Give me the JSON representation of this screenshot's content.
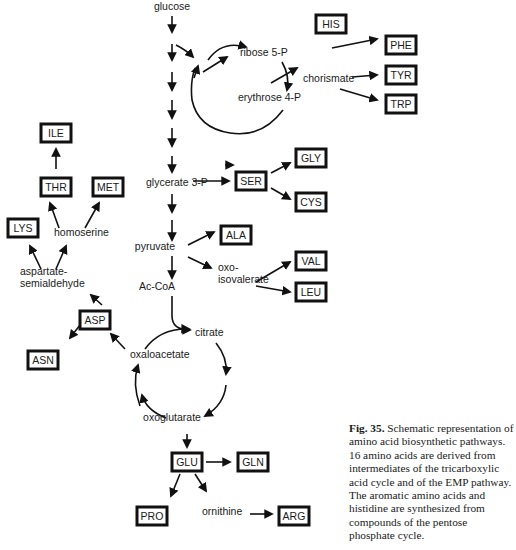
{
  "diagram": {
    "title": "Schematic representation of amino acid biosynthetic pathways",
    "intermediates": [
      {
        "id": "glucose",
        "label": "glucose",
        "x": 172,
        "y": 10
      },
      {
        "id": "ribose5p",
        "label": "ribose  5-P",
        "x": 240,
        "y": 56
      },
      {
        "id": "erythrose4p",
        "label": "erythrose  4-P",
        "x": 238,
        "y": 101
      },
      {
        "id": "chorismate",
        "label": "chorismate",
        "x": 303,
        "y": 82
      },
      {
        "id": "glycerate3p",
        "label": "glycerate  3-P",
        "x": 146,
        "y": 186
      },
      {
        "id": "pyruvate",
        "label": "pyruvate",
        "x": 155,
        "y": 250
      },
      {
        "id": "acCoA",
        "label": "Ac-CoA",
        "x": 157,
        "y": 290
      },
      {
        "id": "oxoisovalerate_1",
        "label": "oxo-",
        "x": 218,
        "y": 271
      },
      {
        "id": "oxoisovalerate_2",
        "label": "isovalerate",
        "x": 218,
        "y": 283
      },
      {
        "id": "homoserine",
        "label": "homoserine",
        "x": 54,
        "y": 236
      },
      {
        "id": "aspsemi_1",
        "label": "aspartate-",
        "x": 20,
        "y": 275
      },
      {
        "id": "aspsemi_2",
        "label": "semialdehyde",
        "x": 20,
        "y": 287
      },
      {
        "id": "citrate",
        "label": "citrate",
        "x": 195,
        "y": 336
      },
      {
        "id": "oxaloacetate",
        "label": "oxaloacetate",
        "x": 130,
        "y": 358
      },
      {
        "id": "oxoglutarate",
        "label": "oxoglutarate",
        "x": 172,
        "y": 421
      },
      {
        "id": "ornithine",
        "label": "ornithine",
        "x": 202,
        "y": 515
      }
    ],
    "amino_acids": [
      {
        "id": "his",
        "label": "HIS",
        "x": 316,
        "y": 15,
        "w": 30,
        "h": 18
      },
      {
        "id": "phe",
        "label": "PHE",
        "x": 386,
        "y": 36,
        "w": 30,
        "h": 18
      },
      {
        "id": "tyr",
        "label": "TYR",
        "x": 386,
        "y": 66,
        "w": 30,
        "h": 18
      },
      {
        "id": "trp",
        "label": "TRP",
        "x": 386,
        "y": 95,
        "w": 30,
        "h": 18
      },
      {
        "id": "ile",
        "label": "ILE",
        "x": 41,
        "y": 124,
        "w": 30,
        "h": 18
      },
      {
        "id": "thr",
        "label": "THR",
        "x": 41,
        "y": 178,
        "w": 30,
        "h": 18
      },
      {
        "id": "met",
        "label": "MET",
        "x": 93,
        "y": 178,
        "w": 30,
        "h": 18
      },
      {
        "id": "lys",
        "label": "LYS",
        "x": 8,
        "y": 219,
        "w": 30,
        "h": 18
      },
      {
        "id": "ser",
        "label": "SER",
        "x": 236,
        "y": 172,
        "w": 30,
        "h": 18
      },
      {
        "id": "gly",
        "label": "GLY",
        "x": 296,
        "y": 149,
        "w": 30,
        "h": 18
      },
      {
        "id": "cys",
        "label": "CYS",
        "x": 296,
        "y": 193,
        "w": 30,
        "h": 18
      },
      {
        "id": "ala",
        "label": "ALA",
        "x": 221,
        "y": 226,
        "w": 30,
        "h": 18
      },
      {
        "id": "val",
        "label": "VAL",
        "x": 296,
        "y": 252,
        "w": 30,
        "h": 18
      },
      {
        "id": "leu",
        "label": "LEU",
        "x": 296,
        "y": 283,
        "w": 30,
        "h": 18
      },
      {
        "id": "asp",
        "label": "ASP",
        "x": 80,
        "y": 311,
        "w": 30,
        "h": 18
      },
      {
        "id": "asn",
        "label": "ASN",
        "x": 28,
        "y": 351,
        "w": 30,
        "h": 18
      },
      {
        "id": "glu",
        "label": "GLU",
        "x": 172,
        "y": 453,
        "w": 30,
        "h": 18
      },
      {
        "id": "gln",
        "label": "GLN",
        "x": 238,
        "y": 453,
        "w": 30,
        "h": 18
      },
      {
        "id": "pro",
        "label": "PRO",
        "x": 137,
        "y": 507,
        "w": 30,
        "h": 18
      },
      {
        "id": "arg",
        "label": "ARG",
        "x": 279,
        "y": 507,
        "w": 30,
        "h": 18
      }
    ],
    "arrows": [
      "M172 16 L172 32",
      "M172 44 L172 60",
      "M172 72 L172 90",
      "M172 100 L172 118",
      "M172 128 L172 146",
      "M172 156 L172 172",
      "M176 45 Q186 50 193 57",
      "M172 194 L172 212",
      "M172 220 L172 240",
      "M172 256 L172 278",
      "M203 72 L227 57",
      "M271 83 L297 68",
      "M225 165 L233 165",
      "M332 48 L377 39",
      "M352 77 L377 75",
      "M340 89 L377 100",
      "M193 181 L229 181",
      "M271 173 L290 163",
      "M271 188 L290 199",
      "M188 245 L214 232",
      "M188 257 L211 268",
      "M256 282 L290 262",
      "M256 286 L290 292",
      "M59 228 L50 203",
      "M85 228 L99 203",
      "M56 169 L56 149",
      "M41 269 L30 246",
      "M56 269 L66 246",
      "M102 305 L91 295",
      "M80 325 L70 338",
      "M125 349 L111 334",
      "M187 434 L187 447",
      "M206 462 L230 462",
      "M180 474 L171 496",
      "M195 474 L206 491",
      "M250 514 L272 514"
    ],
    "cycles": {
      "pentose": {
        "cx": 230,
        "cy": 82,
        "r": 46
      },
      "tca": {
        "cx": 179,
        "cy": 380,
        "r": 46
      }
    }
  },
  "caption": {
    "fig_label": "Fig. 35.",
    "text": " Schematic representation of amino acid biosynthetic pathways. 16 amino acids are derived from intermediates of the tricarboxylic acid cycle and of the EMP pathway. The aromatic amino acids and histidine are synthesized from compounds of the pentose phosphate cycle."
  }
}
